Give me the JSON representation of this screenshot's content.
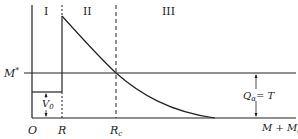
{
  "diagram": {
    "type": "potential-energy-diagram",
    "regions": [
      {
        "label": "I"
      },
      {
        "label": "II"
      },
      {
        "label": "III"
      }
    ],
    "axis_labels": {
      "origin": "O",
      "radius": "R",
      "radius_c": "R",
      "radius_c_sub": "c",
      "m_star": "M*",
      "m_star_base": "M",
      "m_star_sup": "*",
      "baseline": "M + M",
      "baseline_sub": "α",
      "well_depth": "V",
      "well_depth_sub": "0",
      "energy": "Q",
      "energy_sub": "α",
      "energy_eq": "= T"
    },
    "colors": {
      "line": "#222222",
      "background": "#ffffff"
    }
  }
}
